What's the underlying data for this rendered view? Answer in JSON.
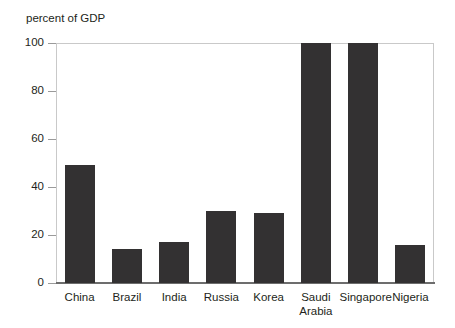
{
  "chart_data": {
    "type": "bar",
    "title": "percent of GDP",
    "xlabel": "",
    "ylabel": "",
    "ylim": [
      0,
      100
    ],
    "yticks": [
      0,
      20,
      40,
      60,
      80,
      100
    ],
    "grid": false,
    "legend": "none",
    "categories": [
      "China",
      "Brazil",
      "India",
      "Russia",
      "Korea",
      "Saudi\nArabia",
      "Singapore",
      "Nigeria"
    ],
    "values": [
      49,
      14,
      17,
      30,
      29,
      100,
      101,
      16
    ],
    "bar_color": "#333132",
    "frame_color": "#c9c9c9",
    "axis_color": "#6d6d6d",
    "text_color": "#231f20",
    "background": "#ffffff"
  },
  "axis": {
    "tick_labels": [
      "100",
      "80",
      "60",
      "40",
      "20",
      "0"
    ]
  },
  "categories_display": {
    "c0": "China",
    "c1": "Brazil",
    "c2": "India",
    "c3": "Russia",
    "c4": "Korea",
    "c5": "Saudi\nArabia",
    "c6": "Singapore",
    "c7": "Nigeria"
  }
}
